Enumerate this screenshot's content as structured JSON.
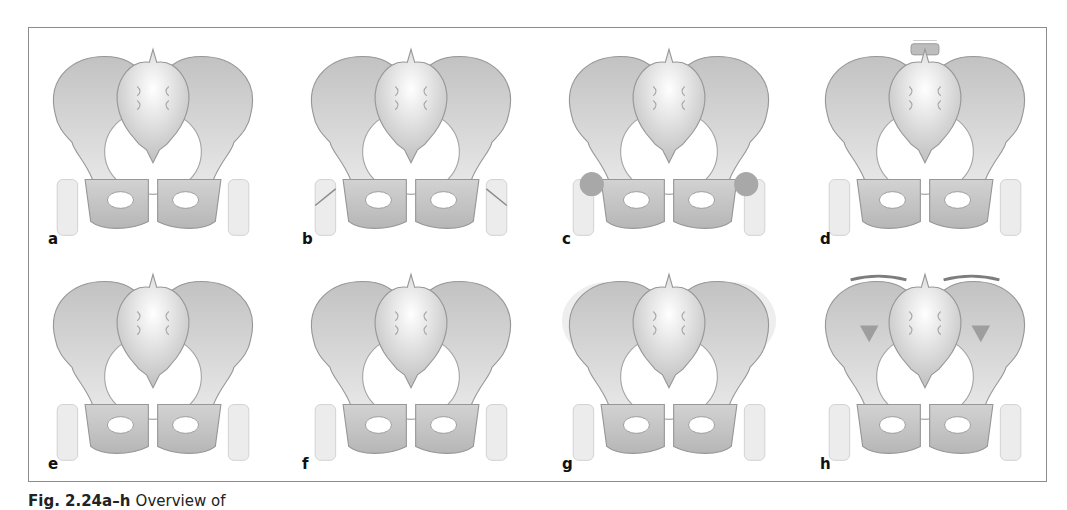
{
  "figure": {
    "caption_number": "Fig. 2.24a–h",
    "caption_text": "Overview of",
    "colors": {
      "frame_border": "#8c8c8c",
      "bone_light": "#dcdcdc",
      "bone_mid": "#c6c6c6",
      "bone_dark": "#b0b0b0",
      "outline": "#979797",
      "arrow": "#8a8a8a"
    },
    "panels": [
      {
        "label": "a",
        "variant": "rotated-iliac-wings"
      },
      {
        "label": "b",
        "variant": "arrows-to-acetabulum"
      },
      {
        "label": "c",
        "variant": "femoral-heads-dark"
      },
      {
        "label": "d",
        "variant": "with-lumbar-vertebrae"
      },
      {
        "label": "e",
        "variant": "dark-iliac-wings"
      },
      {
        "label": "f",
        "variant": "narrow-ilium"
      },
      {
        "label": "g",
        "variant": "wide-iliac-halo"
      },
      {
        "label": "h",
        "variant": "iliac-crest-caps"
      }
    ]
  }
}
